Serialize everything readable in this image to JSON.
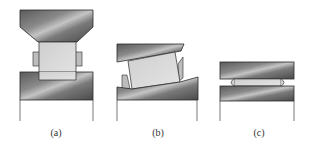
{
  "figure": {
    "panels": [
      {
        "id": "a",
        "label": "(a)",
        "description": "Cylindrical workpiece between flat-bottomed tapered upper die and lower anvil, with side bulges"
      },
      {
        "id": "b",
        "label": "(b)",
        "description": "Workpiece tilted between misaligned upper die and lower anvil"
      },
      {
        "id": "c",
        "label": "(c)",
        "description": "Thin flattened disc between parallel upper and lower plates"
      }
    ]
  },
  "colors": {
    "die_dark": "#4a4a4a",
    "die_light": "#b5b5b5",
    "workpiece": "#d9d9d9",
    "outline": "#2a2a2a"
  }
}
